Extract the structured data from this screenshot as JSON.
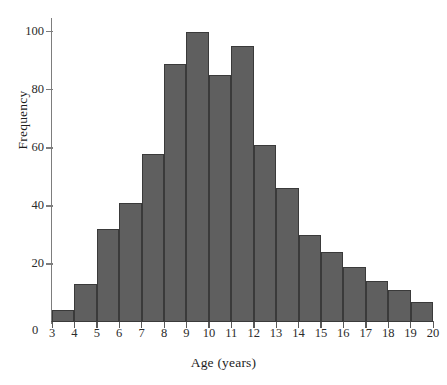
{
  "chart_data": {
    "type": "bar",
    "title": "",
    "xlabel": "Age (years)",
    "ylabel": "Frequency",
    "grid": false,
    "legend": null,
    "bin_width": 1,
    "xlim": [
      3,
      20
    ],
    "ylim": [
      0,
      104
    ],
    "origin_label": "0",
    "bar_color": "#5f5f5f",
    "bar_edge_color": "#3a3a3a",
    "axis_color": "#5a5a5a",
    "x_tick_labels": [
      "3",
      "4",
      "5",
      "6",
      "7",
      "8",
      "9",
      "10",
      "11",
      "12",
      "13",
      "14",
      "15",
      "16",
      "17",
      "18",
      "19",
      "20"
    ],
    "x_tick_values": [
      3,
      4,
      5,
      6,
      7,
      8,
      9,
      10,
      11,
      12,
      13,
      14,
      15,
      16,
      17,
      18,
      19,
      20
    ],
    "y_tick_labels": [
      "20",
      "40",
      "60",
      "80",
      "100"
    ],
    "y_tick_values": [
      20,
      40,
      60,
      80,
      100
    ],
    "categories": [
      "3-4",
      "4-5",
      "5-6",
      "6-7",
      "7-8",
      "8-9",
      "9-10",
      "10-11",
      "11-12",
      "12-13",
      "13-14",
      "14-15",
      "15-16",
      "16-17",
      "17-18",
      "18-19",
      "19-20"
    ],
    "bin_starts": [
      3,
      4,
      5,
      6,
      7,
      8,
      9,
      10,
      11,
      12,
      13,
      14,
      15,
      16,
      17,
      18,
      19
    ],
    "values": [
      4,
      13,
      32,
      41,
      58,
      89,
      100,
      85,
      95,
      61,
      46,
      30,
      24,
      19,
      14,
      11,
      7
    ]
  }
}
